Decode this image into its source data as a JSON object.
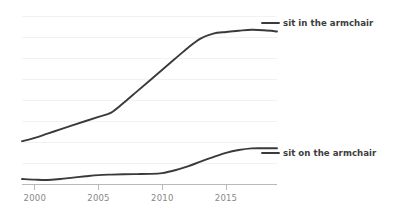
{
  "chart_data": {
    "type": "line",
    "title": "",
    "subtitle": "",
    "xlabel": "",
    "ylabel": "",
    "xlim": [
      1999,
      2019
    ],
    "ylim": [
      0,
      1.0
    ],
    "grid": "horizontal-faint",
    "legend_position": "inline-right",
    "x_ticks": [
      2000,
      2005,
      2010,
      2015
    ],
    "x_tick_labels": [
      "2000",
      "2005",
      "2010",
      "2015"
    ],
    "y_ticks_visible": false,
    "x": [
      1999,
      2000,
      2001,
      2002,
      2003,
      2004,
      2005,
      2006,
      2007,
      2008,
      2009,
      2010,
      2011,
      2012,
      2013,
      2014,
      2015,
      2016,
      2017,
      2018,
      2019
    ],
    "series": [
      {
        "name": "sit in the armchair",
        "color": "#3a3a3a",
        "values": [
          0.255,
          0.275,
          0.3,
          0.325,
          0.35,
          0.375,
          0.4,
          0.425,
          0.485,
          0.55,
          0.615,
          0.68,
          0.745,
          0.81,
          0.865,
          0.895,
          0.905,
          0.912,
          0.918,
          0.915,
          0.908
        ]
      },
      {
        "name": "sit on the armchair",
        "color": "#3a3a3a",
        "values": [
          0.03,
          0.026,
          0.024,
          0.03,
          0.038,
          0.046,
          0.053,
          0.056,
          0.058,
          0.059,
          0.06,
          0.065,
          0.082,
          0.105,
          0.133,
          0.16,
          0.185,
          0.202,
          0.212,
          0.213,
          0.213
        ]
      }
    ]
  },
  "legend": {
    "items": [
      {
        "label": "sit in the armchair"
      },
      {
        "label": "sit on the armchair"
      }
    ]
  },
  "axis": {
    "tick_labels": [
      "2000",
      "2005",
      "2010",
      "2015"
    ]
  }
}
